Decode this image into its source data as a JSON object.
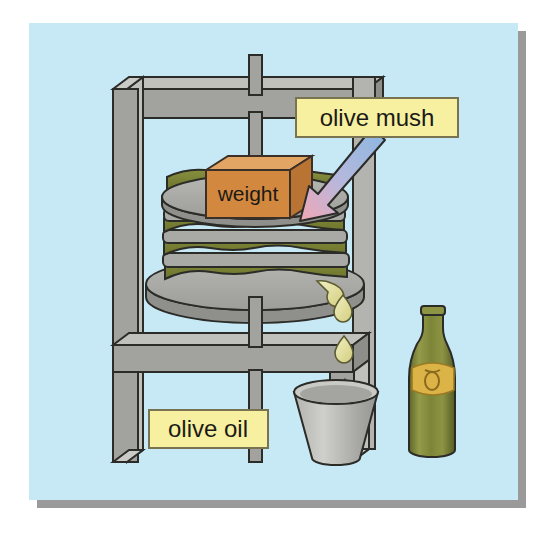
{
  "illustration": {
    "title": "olive press diagram",
    "subject": "traditional screw olive press producing olive oil",
    "canvas": {
      "width": 550,
      "height": 534
    },
    "background": {
      "page_color": "#ffffff",
      "panel_color": "#bfe4f4",
      "panel_color_light": "#cdeaf7",
      "shadow_color": "#9a9a9a",
      "panel_rect": {
        "x": 29,
        "y": 23,
        "width": 489,
        "height": 477
      }
    },
    "labels": [
      {
        "id": "olive-mush",
        "text": "olive mush",
        "box_fill": "#f7f0a0",
        "box_stroke": "#7a7352",
        "text_color": "#1c1a17",
        "x": 296,
        "y": 98,
        "width": 162,
        "height": 39,
        "font_size": 24
      },
      {
        "id": "olive-oil",
        "text": "olive oil",
        "box_fill": "#f7f0a0",
        "box_stroke": "#7a7352",
        "text_color": "#1c1a17",
        "x": 149,
        "y": 410,
        "width": 119,
        "height": 38,
        "font_size": 24
      },
      {
        "id": "weight",
        "text": "weight",
        "box_fill": "#d2883f",
        "box_stroke": "#3a3027",
        "text_color": "#241b12",
        "x": 206,
        "y": 156,
        "width": 106,
        "height": 62,
        "font_size": 21
      }
    ],
    "callout_arrow": {
      "id": "olive-mush-arrow",
      "from_label": "olive mush",
      "points_to": "olive mush layers in press",
      "color_start": "#8ab7e0",
      "color_end": "#f2a6b4",
      "tail_x": 368,
      "tail_y": 136,
      "tip_x": 312,
      "tip_y": 212
    },
    "parts": [
      {
        "id": "press-frame",
        "name": "wooden press frame",
        "color_front": "#9b9b98",
        "color_side": "#8a8a87",
        "color_top": "#b5b5b2",
        "outline": "#2b2b28"
      },
      {
        "id": "screw-rod",
        "name": "vertical screw rod",
        "color": "#9b9b98",
        "outline": "#2b2b28",
        "x": 249,
        "top_y": 55,
        "bottom_y": 462,
        "width": 13
      },
      {
        "id": "upper-press-plate",
        "name": "upper press plate",
        "color": "#a9a9a6",
        "color_edge": "#8d8d8a",
        "outline": "#2b2b28",
        "cx": 255,
        "cy": 197,
        "rx": 93,
        "ry": 22
      },
      {
        "id": "lower-press-plate",
        "name": "lower press plate",
        "color": "#a9a9a6",
        "color_edge": "#8d8d8a",
        "outline": "#2b2b28",
        "cx": 255,
        "cy": 288,
        "rx": 109,
        "ry": 26
      },
      {
        "id": "mush-stack",
        "name": "stack of olive mush layers between mats",
        "mush_color": "#7c8434",
        "mush_shadow": "#636a27",
        "mat_color": "#a9a9a6",
        "outline": "#2b2b28",
        "layer_count": 5
      },
      {
        "id": "weight-block",
        "name": "weight block",
        "front_color": "#d2883f",
        "top_color": "#e3a563",
        "side_color": "#b97333",
        "outline": "#3a3027"
      },
      {
        "id": "oil-drops",
        "name": "falling olive oil drops",
        "color": "#ddd98f",
        "highlight": "#f0eebb",
        "outline": "#5d5c33",
        "count": 3,
        "positions": [
          {
            "x": 343,
            "y": 303
          },
          {
            "x": 344,
            "y": 345
          },
          {
            "x": 345,
            "y": 388
          }
        ]
      },
      {
        "id": "bucket",
        "name": "collecting bucket",
        "color_light": "#c3c3c0",
        "color_dark": "#9e9e9b",
        "rim_color": "#b8b8b5",
        "outline": "#2b2b28",
        "cx": 335,
        "top_y": 388,
        "bottom_y": 460
      },
      {
        "id": "oil-bottle",
        "name": "olive oil bottle",
        "glass_light": "#8c9445",
        "glass_mid": "#757c32",
        "glass_dark": "#5d6327",
        "label_color": "#dcb347",
        "label_stroke": "#9a7a22",
        "outline": "#2b2b28",
        "cx": 430,
        "top_y": 309,
        "bottom_y": 455
      }
    ]
  }
}
